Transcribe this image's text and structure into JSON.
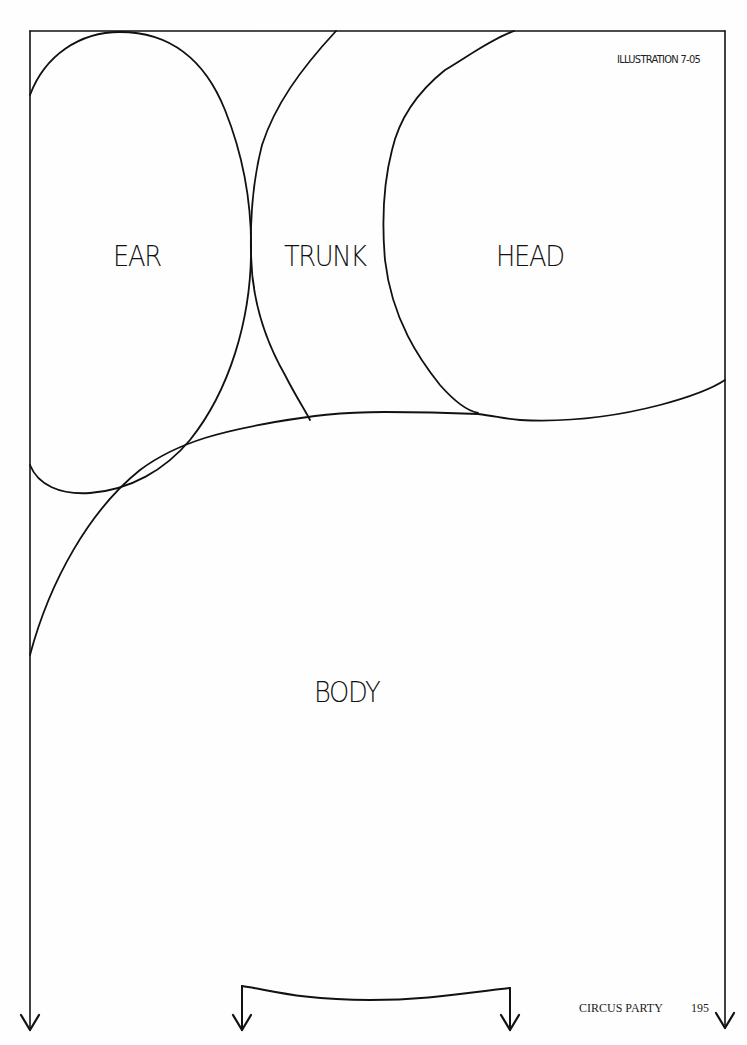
{
  "page": {
    "illustration_id": "ILLUSTRATION 7-05",
    "footer": {
      "section": "CIRCUS PARTY",
      "page_number": "195"
    }
  },
  "pattern": {
    "pieces": [
      {
        "id": "ear",
        "label": "EAR"
      },
      {
        "id": "trunk",
        "label": "TRUNK"
      },
      {
        "id": "head",
        "label": "HEAD"
      },
      {
        "id": "body",
        "label": "BODY"
      }
    ],
    "arrows": [
      {
        "id": "left-edge-arrow",
        "direction": "down"
      },
      {
        "id": "right-edge-arrow",
        "direction": "down"
      },
      {
        "id": "bracket-left-arrow",
        "direction": "down"
      },
      {
        "id": "bracket-right-arrow",
        "direction": "down"
      }
    ],
    "colors": {
      "line": "#111111",
      "paper": "#fefefe"
    }
  }
}
